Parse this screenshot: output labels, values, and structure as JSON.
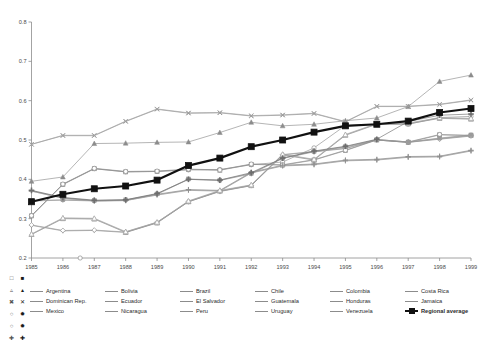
{
  "chart_data": {
    "type": "line",
    "title": "",
    "xlabel": "",
    "ylabel": "",
    "xlim": [
      1985,
      1999
    ],
    "ylim": [
      0.2,
      0.8
    ],
    "yticks": [
      "0.2",
      "0.3",
      "0.4",
      "0.5",
      "0.6",
      "0.7",
      "0.8"
    ],
    "ytick_values": [
      0.2,
      0.3,
      0.4,
      0.5,
      0.6,
      0.7,
      0.8
    ],
    "grid": false,
    "legend_position": "bottom",
    "x": [
      1985,
      1986,
      1987,
      1988,
      1989,
      1990,
      1991,
      1992,
      1993,
      1994,
      1995,
      1996,
      1997,
      1998,
      1999
    ],
    "xtick_labels": [
      "1985",
      "1986",
      "1987",
      "1988",
      "1989",
      "1990",
      "1991",
      "1992",
      "1993",
      "1994",
      "1995",
      "1996",
      "1997",
      "1998",
      "1999"
    ],
    "series": [
      {
        "name": "Argentina",
        "marker": "triangle-open",
        "color": "#8c8c8c",
        "values": [
          0.26,
          0.3,
          0.299,
          0.265,
          0.289,
          0.343,
          0.37,
          0.384,
          0.462,
          0.449,
          0.512,
          0.54,
          0.541,
          0.555,
          0.553
        ]
      },
      {
        "name": "Bolivia",
        "marker": "x",
        "color": "#8c8c8c",
        "values": [
          0.489,
          0.511,
          0.511,
          0.547,
          0.578,
          0.568,
          0.569,
          0.561,
          0.563,
          0.567,
          0.546,
          0.585,
          0.585,
          0.59,
          0.601
        ]
      },
      {
        "name": "Brazil",
        "marker": "plus",
        "color": "#8c8c8c",
        "values": [
          0.37,
          0.352,
          0.345,
          0.346,
          0.36,
          0.372,
          0.37,
          0.416,
          0.434,
          0.437,
          0.447,
          0.449,
          0.456,
          0.457,
          0.472
        ]
      },
      {
        "name": "Chile",
        "marker": "triangle-filled",
        "color": "#8c8c8c",
        "values": [
          0.395,
          0.406,
          0.491,
          0.492,
          0.494,
          0.495,
          0.519,
          0.545,
          0.536,
          0.54,
          0.549,
          0.556,
          0.585,
          0.649,
          0.665
        ]
      },
      {
        "name": "Colombia",
        "marker": "circle-open",
        "color": "#8c8c8c",
        "values": [
          0.307,
          0.387,
          0.427,
          0.419,
          0.42,
          0.424,
          0.425,
          0.437,
          0.444,
          0.48,
          0.537,
          0.54,
          0.54,
          0.557,
          0.56
        ]
      },
      {
        "name": "Costa Rica",
        "marker": "diamond-filled",
        "color": "#8c8c8c",
        "values": [
          0.283,
          0.269,
          0.27,
          0.265,
          0.29,
          0.343,
          0.369,
          0.384,
          0.462,
          0.47,
          0.478,
          0.5,
          0.494,
          0.502,
          0.51
        ]
      },
      {
        "name": "Dominican Rep.",
        "marker": "circle-filled",
        "color": "#8c8c8c",
        "values": [
          0.345,
          0.347,
          0.345,
          0.347,
          0.362,
          0.4,
          0.397,
          0.414,
          0.453,
          0.47,
          0.482,
          0.5,
          0.494,
          0.504,
          0.512
        ]
      },
      {
        "name": "Ecuador",
        "marker": "square-open",
        "color": "#8c8c8c",
        "values": [
          0.307,
          0.387,
          0.427,
          0.419,
          0.42,
          0.425,
          0.423,
          0.438,
          0.436,
          0.449,
          0.473,
          0.5,
          0.494,
          0.513,
          0.511
        ]
      },
      {
        "name": "El Salvador",
        "marker": "plus-light",
        "color": "#a8a8a8",
        "values": [
          0.37,
          0.352,
          0.345,
          0.346,
          0.361,
          0.373,
          0.371,
          0.417,
          0.435,
          0.438,
          0.448,
          0.45,
          0.457,
          0.458,
          0.473
        ]
      },
      {
        "name": "Guatemala",
        "marker": "triangle-open",
        "color": "#9a9a9a",
        "values": [
          0.26,
          0.301,
          0.3,
          0.266,
          0.29,
          0.344,
          0.371,
          0.385,
          0.463,
          0.45,
          0.513,
          0.541,
          0.542,
          0.556,
          0.554
        ]
      },
      {
        "name": "Honduras",
        "marker": "x-light",
        "color": "#a0a0a0",
        "values": [
          0.489,
          0.512,
          0.512,
          0.548,
          0.579,
          0.569,
          0.57,
          0.562,
          0.564,
          0.568,
          0.547,
          0.586,
          0.586,
          0.591,
          0.602
        ]
      },
      {
        "name": "Jamaica",
        "marker": "diamond-open",
        "color": "#9a9a9a",
        "values": [
          0.284,
          0.27,
          0.271,
          0.266,
          0.291,
          0.344,
          0.37,
          0.385,
          0.463,
          0.471,
          0.479,
          0.501,
          0.495,
          0.503,
          0.511
        ]
      },
      {
        "name": "Mexico",
        "marker": "circle-open",
        "color": "#8c8c8c",
        "values": [
          0.308,
          0.388,
          0.428,
          0.42,
          0.421,
          0.426,
          0.424,
          0.439,
          0.437,
          0.45,
          0.474,
          0.501,
          0.495,
          0.514,
          0.512
        ]
      },
      {
        "name": "Nicaragua",
        "marker": "square-filled-small",
        "color": "#9a9a9a",
        "values": [
          0.346,
          0.348,
          0.346,
          0.348,
          0.363,
          0.401,
          0.398,
          0.415,
          0.454,
          0.471,
          0.483,
          0.501,
          0.495,
          0.505,
          0.513
        ]
      },
      {
        "name": "Peru",
        "marker": "plus",
        "color": "#8c8c8c",
        "values": [
          0.371,
          0.353,
          0.346,
          0.347,
          0.362,
          0.374,
          0.372,
          0.418,
          0.436,
          0.439,
          0.449,
          0.451,
          0.458,
          0.459,
          0.474
        ]
      },
      {
        "name": "Uruguay",
        "marker": "triangle-open-light",
        "color": "#a8a8a8",
        "values": [
          0.261,
          0.302,
          0.301,
          0.267,
          0.291,
          0.345,
          0.372,
          0.386,
          0.464,
          0.451,
          0.514,
          0.542,
          0.543,
          0.557,
          0.555
        ]
      },
      {
        "name": "Venezuela",
        "marker": "plus-bold",
        "color": "#6e6e6e",
        "values": [
          0.372,
          0.354,
          0.347,
          0.348,
          0.364,
          0.4,
          0.398,
          0.417,
          0.454,
          0.472,
          0.484,
          0.502,
          0.547,
          0.563,
          0.566
        ]
      },
      {
        "name": "Regional average",
        "marker": "square-filled",
        "color": "#111111",
        "emphasis": true,
        "values": [
          0.343,
          0.362,
          0.376,
          0.383,
          0.398,
          0.435,
          0.454,
          0.483,
          0.5,
          0.52,
          0.536,
          0.54,
          0.548,
          0.57,
          0.58
        ]
      }
    ]
  },
  "legend": {
    "items": [
      {
        "label": "Argentina",
        "bold": false
      },
      {
        "label": "Bolivia",
        "bold": false
      },
      {
        "label": "Brazil",
        "bold": false
      },
      {
        "label": "Chile",
        "bold": false
      },
      {
        "label": "Colombia",
        "bold": false
      },
      {
        "label": "Costa Rica",
        "bold": false
      },
      {
        "label": "Dominican Rep.",
        "bold": false
      },
      {
        "label": "Ecuador",
        "bold": false
      },
      {
        "label": "El Salvador",
        "bold": false
      },
      {
        "label": "Guatemala",
        "bold": false
      },
      {
        "label": "Honduras",
        "bold": false
      },
      {
        "label": "Jamaica",
        "bold": false
      },
      {
        "label": "Mexico",
        "bold": false
      },
      {
        "label": "Nicaragua",
        "bold": false
      },
      {
        "label": "Peru",
        "bold": false
      },
      {
        "label": "Uruguay",
        "bold": false
      },
      {
        "label": "Venezuela",
        "bold": false
      },
      {
        "label": "Regional average",
        "bold": true
      }
    ]
  },
  "marker_key": {
    "symbols": [
      "□",
      "■",
      "▵",
      "▴",
      "✖",
      "✕",
      "○",
      "✹",
      "○",
      "✹",
      "✚",
      "✚"
    ]
  }
}
